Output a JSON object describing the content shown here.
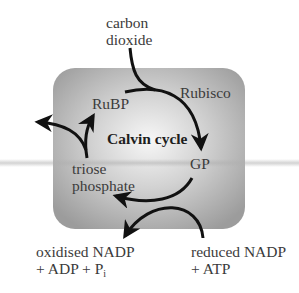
{
  "diagram": {
    "title": "Calvin cycle",
    "inputs": {
      "carbon_dioxide_line1": "carbon",
      "carbon_dioxide_line2": "dioxide",
      "reduced_line1": "reduced NADP",
      "reduced_line2": "+ ATP"
    },
    "outputs": {
      "oxidised_line1": "oxidised NADP",
      "oxidised_line2_prefix": "+ ADP + P",
      "oxidised_line2_sub": "i"
    },
    "nodes": {
      "rubp": "RuBP",
      "rubisco": "Rubisco",
      "gp": "GP",
      "triose_line1": "triose",
      "triose_line2": "phosphate"
    },
    "colors": {
      "box_edge": "#9a9a9a",
      "box_center": "#f4f4f4",
      "arrow": "#111111"
    }
  }
}
